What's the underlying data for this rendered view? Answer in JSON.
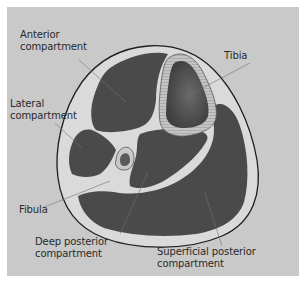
{
  "diagram": {
    "type": "anatomical cross-section",
    "colors": {
      "panel_background": "#c9c9c9",
      "muscle": "#4a4a4a",
      "fascia": "#dcdcdc",
      "outline": "#222222",
      "bone_marrow": "#555555",
      "leader_line": "#666666"
    }
  },
  "labels": {
    "anterior": {
      "line1": "Anterior",
      "line2": "compartment"
    },
    "tibia": {
      "line1": "Tibia"
    },
    "lateral": {
      "line1": "Lateral",
      "line2": "compartment"
    },
    "fibula": {
      "line1": "Fibula"
    },
    "deep_posterior": {
      "line1": "Deep posterior",
      "line2": "compartment"
    },
    "superficial_posterior": {
      "line1": "Superficial posterior",
      "line2": "compartment"
    }
  }
}
